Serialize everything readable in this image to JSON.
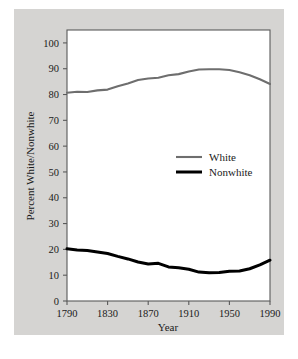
{
  "figure": {
    "background_color": "#ffffff",
    "panel_color": "#d5d4d2",
    "plot_background_color": "#ffffff",
    "frame_color": "#5a5a5a"
  },
  "chart_data": {
    "type": "line",
    "title": "",
    "xlabel": "Year",
    "ylabel": "Percent White/Nonwhite",
    "xlim": [
      1790,
      1990
    ],
    "ylim": [
      0,
      105
    ],
    "xticks": [
      1790,
      1830,
      1870,
      1910,
      1950,
      1990
    ],
    "xtick_labels": [
      "1790",
      "1830",
      "1870",
      "1910",
      "1950",
      "1990"
    ],
    "yticks": [
      0,
      10,
      20,
      30,
      40,
      50,
      60,
      70,
      80,
      90,
      100
    ],
    "ytick_labels": [
      "0",
      "10",
      "20",
      "30",
      "40",
      "50",
      "60",
      "70",
      "80",
      "90",
      "100"
    ],
    "grid": false,
    "legend_position": "center",
    "x": [
      1790,
      1800,
      1810,
      1820,
      1830,
      1840,
      1850,
      1860,
      1870,
      1880,
      1890,
      1900,
      1910,
      1920,
      1930,
      1940,
      1950,
      1960,
      1970,
      1980,
      1990
    ],
    "series": [
      {
        "name": "White",
        "color": "#6e6e6e",
        "line_width": 2.1,
        "values": [
          80.7,
          81.1,
          81.0,
          81.6,
          81.9,
          83.2,
          84.3,
          85.6,
          86.2,
          86.5,
          87.5,
          87.9,
          88.9,
          89.7,
          89.8,
          89.8,
          89.5,
          88.6,
          87.5,
          85.9,
          84.1
        ]
      },
      {
        "name": "Nonwhite",
        "color": "#000000",
        "line_width": 3.0,
        "values": [
          20.2,
          19.8,
          19.6,
          19.0,
          18.4,
          17.3,
          16.3,
          15.1,
          14.3,
          14.6,
          13.2,
          12.9,
          12.3,
          11.2,
          10.9,
          11.0,
          11.5,
          11.6,
          12.5,
          14.0,
          15.8
        ]
      }
    ],
    "legend": [
      {
        "label": "White",
        "color": "#6e6e6e",
        "line_width": 2.1
      },
      {
        "label": "Nonwhite",
        "color": "#000000",
        "line_width": 3.0
      }
    ]
  }
}
